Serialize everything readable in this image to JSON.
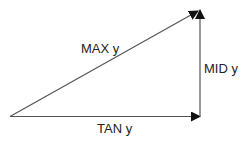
{
  "diagram": {
    "labels": {
      "hypotenuse": "MAX y",
      "vertical": "MID y",
      "horizontal": "TAN y"
    },
    "colors": {
      "line": "#555555",
      "arrow": "#111111",
      "text": "#222222"
    }
  }
}
